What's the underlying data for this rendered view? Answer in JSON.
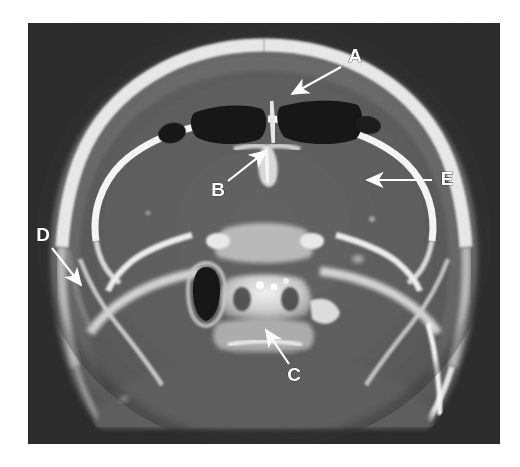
{
  "figure": {
    "type": "ct-axial-skull-base",
    "modality": "CT",
    "plane": "axial",
    "window": "bone",
    "frame": {
      "x": 28,
      "y": 23,
      "width": 472,
      "height": 421
    },
    "background_color": "#2b2b2b",
    "page_background": "#ffffff",
    "ghost_caption": ""
  },
  "palette": {
    "page_bg": "#ffffff",
    "scan_bg": "#2b2b2b",
    "soft_tissue": "#6a6a6a",
    "brain": "#5c5c5c",
    "bone_bright": "#f2f2f2",
    "bone_mid": "#c9c9c9",
    "bone_dim": "#9a9a9a",
    "air": "#141414",
    "annotation": "#ffffff"
  },
  "annotations": {
    "color": "#ffffff",
    "style": "bold-uppercase-with-arrow",
    "items": [
      {
        "id": "A",
        "label": "A",
        "label_x": 355,
        "label_y": 57,
        "arrow_from_x": 341,
        "arrow_from_y": 67,
        "arrow_to_x": 289,
        "arrow_to_y": 96,
        "target": "frontal-sinus-air-cell"
      },
      {
        "id": "B",
        "label": "B",
        "label_x": 218,
        "label_y": 191,
        "arrow_from_x": 228,
        "arrow_from_y": 181,
        "arrow_to_x": 269,
        "arrow_to_y": 148,
        "target": "crista-galli-ethmoid"
      },
      {
        "id": "C",
        "label": "C",
        "label_x": 294,
        "label_y": 376,
        "arrow_from_x": 289,
        "arrow_from_y": 364,
        "arrow_to_x": 264,
        "arrow_to_y": 326,
        "target": "clivus-basiocciput"
      },
      {
        "id": "D",
        "label": "D",
        "label_x": 43,
        "label_y": 236,
        "arrow_from_x": 52,
        "arrow_from_y": 248,
        "arrow_to_x": 84,
        "arrow_to_y": 289,
        "target": "outer-table-scalp"
      },
      {
        "id": "E",
        "label": "E",
        "label_x": 447,
        "label_y": 180,
        "arrow_from_x": 432,
        "arrow_from_y": 180,
        "arrow_to_x": 364,
        "arrow_to_y": 180,
        "target": "greater-sphenoid-wing-orbital-roof"
      }
    ]
  }
}
